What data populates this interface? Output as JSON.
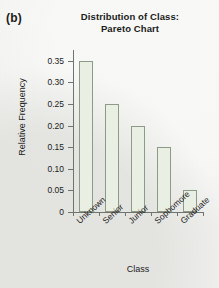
{
  "panel": {
    "label": "(b)"
  },
  "chart_data": {
    "type": "bar",
    "title": "Distribution of Class: Pareto Chart",
    "title_lines": [
      "Distribution of Class:",
      "Pareto Chart"
    ],
    "xlabel": "Class",
    "ylabel": "Relative Frequency",
    "categories": [
      "Unknown",
      "Senior",
      "Junior",
      "Sophomore",
      "Graduate"
    ],
    "values": [
      0.35,
      0.25,
      0.2,
      0.15,
      0.05
    ],
    "ylim": [
      0,
      0.375
    ],
    "yticks": [
      0,
      0.05,
      0.1,
      0.15,
      0.2,
      0.25,
      0.3,
      0.35
    ],
    "ytick_labels": [
      "0",
      "0.05",
      "0.10",
      "0.15",
      "0.20",
      "0.25",
      "0.30",
      "0.35"
    ],
    "grid": false,
    "legend": "none",
    "bar_fill_color": "#e9efe2",
    "bar_edge_color": "#8d9a88",
    "axis_color": "#6f7470",
    "background_color": "#f2f2f0"
  }
}
